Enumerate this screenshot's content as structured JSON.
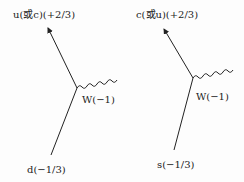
{
  "diagrams": [
    {
      "top_label": "u(或c)(+2/3)",
      "boson_label": "W(−1)",
      "bottom_label": "d(−1/3)"
    },
    {
      "top_label": "c(或u)(+2/3)",
      "boson_label": "W(−1)",
      "bottom_label": "s(−1/3)"
    }
  ],
  "colors": {
    "line": "#222222",
    "background": "#fdfdfd"
  }
}
